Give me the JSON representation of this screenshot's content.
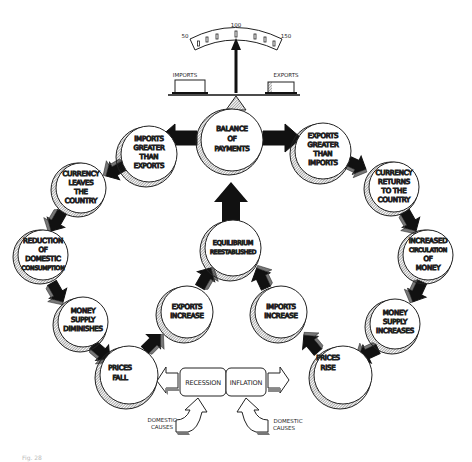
{
  "diagram": {
    "gauge": {
      "ticks": [
        "50",
        "100",
        "150"
      ],
      "left_label": "IMPORTS",
      "right_label": "EXPORTS"
    },
    "nodes": {
      "balance": [
        "BALANCE",
        "OF",
        "PAYMENTS"
      ],
      "imports_greater": [
        "IMPORTS",
        "GREATER",
        "THAN",
        "EXPORTS"
      ],
      "exports_greater": [
        "EXPORTS",
        "GREATER",
        "THAN",
        "IMPORTS"
      ],
      "currency_leaves": [
        "CURRENCY",
        "LEAVES",
        "THE",
        "COUNTRY"
      ],
      "currency_returns": [
        "CURRENCY",
        "RETURNS",
        "TO THE",
        "COUNTRY"
      ],
      "reduction": [
        "REDUCTION",
        "OF",
        "DOMESTIC",
        "CONSUMPTION"
      ],
      "increased_circulation": [
        "INCREASED",
        "CIRCULATION",
        "OF",
        "MONEY"
      ],
      "supply_diminishes": [
        "MONEY",
        "SUPPLY",
        "DIMINISHES"
      ],
      "supply_increases": [
        "MONEY",
        "SUPPLY",
        "INCREASES"
      ],
      "prices_fall": [
        "PRICES",
        "FALL"
      ],
      "prices_rise": [
        "PRICES",
        "RISE"
      ],
      "equilibrium": [
        "EQUILIBRIUM",
        "REESTABLISHED"
      ],
      "exports_increase": [
        "EXPORTS",
        "INCREASE"
      ],
      "imports_increase": [
        "IMPORTS",
        "INCREASE"
      ]
    },
    "boxes": {
      "recession": "RECESSION",
      "inflation": "INFLATION"
    },
    "causes": {
      "left": [
        "DOMESTIC",
        "CAUSES"
      ],
      "right": [
        "DOMESTIC",
        "CAUSES"
      ]
    },
    "caption": "Fig. 28"
  }
}
